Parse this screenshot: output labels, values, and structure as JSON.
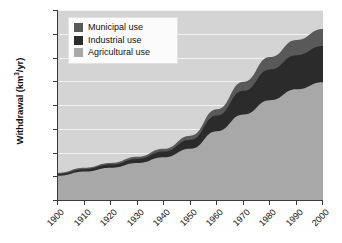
{
  "chart_data": {
    "type": "area",
    "stacked": true,
    "title": "",
    "xlabel": "",
    "ylabel": "Withdrawal (km3/yr)",
    "ylabel_display": "Withdrawal (km³/yr)",
    "x": [
      1900,
      1910,
      1920,
      1930,
      1940,
      1950,
      1960,
      1970,
      1980,
      1990,
      2000
    ],
    "xtick_labels": [
      "1900",
      "1910",
      "1920",
      "1930",
      "1940",
      "1950",
      "1960",
      "1970",
      "1980",
      "1990",
      "2000"
    ],
    "ytick_labels": [
      "0",
      "500",
      "1000",
      "1500",
      "2000",
      "2500",
      "3000",
      "3500",
      "4000"
    ],
    "ylim": [
      0,
      4000
    ],
    "xlim": [
      1900,
      2000
    ],
    "ytick_step": 500,
    "grid": true,
    "grid_color": "#f2f2f2",
    "plot_background": "#d4d4d4",
    "legend_position": "top-left",
    "series": [
      {
        "name": "Agricultural use",
        "key": "agricultural",
        "color": "#a8a8a8",
        "values": [
          510,
          600,
          680,
          780,
          900,
          1080,
          1450,
          1800,
          2100,
          2330,
          2480
        ]
      },
      {
        "name": "Industrial use",
        "key": "industrial",
        "color": "#2b2b2b",
        "values": [
          40,
          50,
          65,
          85,
          120,
          190,
          330,
          500,
          650,
          720,
          760
        ]
      },
      {
        "name": "Municipal use",
        "key": "municipal",
        "color": "#595959",
        "values": [
          25,
          30,
          35,
          45,
          60,
          85,
          130,
          190,
          260,
          320,
          360
        ]
      }
    ],
    "stack_tops": {
      "agricultural": [
        510,
        600,
        680,
        780,
        900,
        1080,
        1450,
        1800,
        2100,
        2330,
        2480
      ],
      "industrial": [
        550,
        650,
        745,
        865,
        1020,
        1270,
        1780,
        2300,
        2750,
        3050,
        3240
      ],
      "municipal": [
        575,
        680,
        780,
        910,
        1080,
        1355,
        1910,
        2490,
        3010,
        3370,
        3600
      ]
    }
  },
  "legend": {
    "items": [
      {
        "label": "Municipal use",
        "color": "#595959"
      },
      {
        "label": "Industrial use",
        "color": "#2b2b2b"
      },
      {
        "label": "Agricultural use",
        "color": "#a8a8a8"
      }
    ]
  }
}
